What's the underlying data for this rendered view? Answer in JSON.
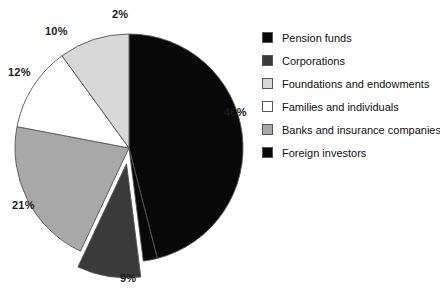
{
  "chart_data": {
    "type": "pie",
    "title": "",
    "subtitle": "",
    "xlabel": "",
    "ylabel": "",
    "legend_position": "right",
    "grid": false,
    "start_angle_deg": 0,
    "direction": "clockwise",
    "categories": [
      "Pension funds",
      "Foreign investors",
      "Corporations",
      "Banks and insurance companies",
      "Families and individuals",
      "Foundations and endowments"
    ],
    "values": [
      46,
      2,
      9,
      21,
      12,
      10
    ],
    "value_labels": [
      "46%",
      "2%",
      "9%",
      "21%",
      "12%",
      "10%"
    ],
    "colors": [
      "#080808",
      "#080808",
      "#3a3a3a",
      "#a8a8a8",
      "#ffffff",
      "#d8d8d8"
    ],
    "slices": [
      {
        "label": "Pension funds",
        "value": 46,
        "value_label": "46%",
        "color": "#080808",
        "exploded": false,
        "label_x": 224,
        "label_y": 106
      },
      {
        "label": "Foreign investors",
        "value": 2,
        "value_label": "2%",
        "color": "#080808",
        "exploded": false,
        "label_x": 112,
        "label_y": 8
      },
      {
        "label": "Corporations",
        "value": 9,
        "value_label": "9%",
        "color": "#3a3a3a",
        "exploded": true,
        "label_x": 120,
        "label_y": 272
      },
      {
        "label": "Banks and insurance companies",
        "value": 21,
        "value_label": "21%",
        "color": "#a8a8a8",
        "exploded": false,
        "label_x": 12,
        "label_y": 199
      },
      {
        "label": "Families and individuals",
        "value": 12,
        "value_label": "12%",
        "color": "#ffffff",
        "exploded": false,
        "label_x": 8,
        "label_y": 66
      },
      {
        "label": "Foundations and endowments",
        "value": 10,
        "value_label": "10%",
        "color": "#d8d8d8",
        "exploded": false,
        "label_x": 45,
        "label_y": 25
      }
    ]
  },
  "legend": {
    "items": [
      {
        "label": "Pension funds",
        "color": "#080808"
      },
      {
        "label": "Corporations",
        "color": "#3a3a3a"
      },
      {
        "label": "Foundations and endowments",
        "color": "#d8d8d8"
      },
      {
        "label": "Families and individuals",
        "color": "#ffffff"
      },
      {
        "label": "Banks and insurance companies",
        "color": "#a8a8a8"
      },
      {
        "label": "Foreign investors",
        "color": "#080808"
      }
    ]
  }
}
